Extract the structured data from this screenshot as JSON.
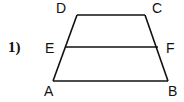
{
  "problem_number": "1)",
  "figure": {
    "type": "trapezoid",
    "points": {
      "A": "A",
      "B": "B",
      "C": "C",
      "D": "D",
      "E": "E",
      "F": "F"
    },
    "segments": [
      "AB",
      "BC",
      "CD",
      "DA",
      "EF"
    ]
  }
}
